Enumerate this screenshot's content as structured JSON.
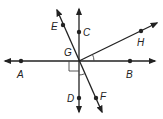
{
  "diagram": {
    "type": "geometry-lines-angles",
    "center_label": "G",
    "points": [
      {
        "label": "A",
        "x": 21,
        "y": 61
      },
      {
        "label": "B",
        "x": 130,
        "y": 61
      },
      {
        "label": "C",
        "x": 79,
        "y": 32
      },
      {
        "label": "D",
        "x": 79,
        "y": 98
      },
      {
        "label": "E",
        "x": 63,
        "y": 25
      },
      {
        "label": "F",
        "x": 96,
        "y": 98
      },
      {
        "label": "G",
        "x": 79,
        "y": 61
      },
      {
        "label": "H",
        "x": 141,
        "y": 31
      }
    ],
    "lines": [
      {
        "name": "line AB",
        "through": [
          "A",
          "B"
        ]
      },
      {
        "name": "line CD",
        "through": [
          "C",
          "D"
        ]
      },
      {
        "name": "line EF",
        "through": [
          "E",
          "F"
        ]
      },
      {
        "name": "ray GH",
        "through": [
          "G",
          "H"
        ]
      }
    ],
    "marks": [
      {
        "type": "right-angle",
        "between": [
          "A",
          "D"
        ],
        "at": "G"
      },
      {
        "type": "angle-arc",
        "between": [
          "B",
          "H"
        ],
        "at": "G"
      },
      {
        "type": "angle-arc",
        "between": [
          "D",
          "F"
        ],
        "at": "G"
      }
    ],
    "labels": {
      "A": "A",
      "B": "B",
      "C": "C",
      "D": "D",
      "E": "E",
      "F": "F",
      "G": "G",
      "H": "H"
    },
    "colors": {
      "line": "#222222",
      "background": "#ffffff"
    }
  }
}
